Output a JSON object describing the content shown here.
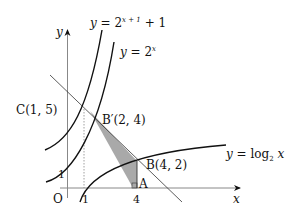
{
  "labels": {
    "y_axis": "y",
    "x_axis": "x",
    "origin": "O",
    "tick_x1": "1",
    "tick_x4": "4",
    "tick_y1": "1",
    "curve_shifted": {
      "lhs": "y",
      "eq": " = 2",
      "exp": "x + 1",
      "tail": " + 1"
    },
    "curve_exp": {
      "lhs": "y",
      "eq": " = 2",
      "exp": "x"
    },
    "curve_log": {
      "lhs": "y",
      "eq": " = log",
      "sub": "2",
      "var": " x"
    },
    "point_C": "C(1,  5)",
    "point_Bp": "B′(2,  4)",
    "point_B": "B(4,  2)",
    "point_A": "A"
  },
  "points": {
    "C": [
      1,
      5
    ],
    "B_prime": [
      2,
      4
    ],
    "B": [
      4,
      2
    ],
    "A": [
      4,
      0
    ]
  },
  "colors": {
    "stroke": "#1a1a1a",
    "shade": "#a9a9a9",
    "axis": "#888888"
  }
}
